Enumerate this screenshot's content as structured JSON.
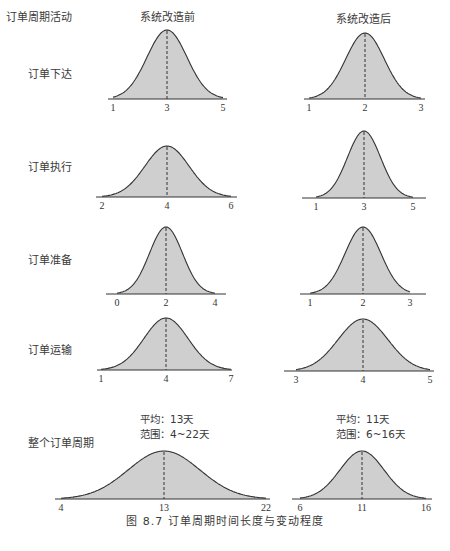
{
  "header": {
    "row_label_title": "订单周期活动",
    "col_before": "系统改造前",
    "col_after": "系统改造后"
  },
  "rows": [
    {
      "label": "订单下达"
    },
    {
      "label": "订单执行"
    },
    {
      "label": "订单准备"
    },
    {
      "label": "订单运输"
    },
    {
      "label": "整个订单周期"
    }
  ],
  "summary": {
    "before": {
      "mean": "平均：13天",
      "range": "范围：4~22天"
    },
    "after": {
      "mean": "平均：11天",
      "range": "范围：6~16天"
    }
  },
  "caption": "图 8.7   订单周期时间长度与变动程度",
  "colors": {
    "fill": "#cfcfcf",
    "stroke": "#333333",
    "axis": "#333333"
  },
  "chart_data": {
    "type": "area",
    "title": "订单周期时间长度与变动程度",
    "figure_number": "图 8.7",
    "columns": [
      "系统改造前",
      "系统改造后"
    ],
    "rows": [
      "订单下达",
      "订单执行",
      "订单准备",
      "订单运输",
      "整个订单周期"
    ],
    "xlabel": "",
    "ylabel": "",
    "grid": false,
    "curves": [
      {
        "row": "订单下达",
        "column": "系统改造前",
        "min": 1,
        "mean": 3,
        "max": 5,
        "ticks": [
          "1",
          "3",
          "5"
        ],
        "geom": {
          "x0": 108,
          "x1": 227,
          "cx": 167,
          "base": 99,
          "peak": 30,
          "tl": 113,
          "tr": 223,
          "spread": 58
        }
      },
      {
        "row": "订单下达",
        "column": "系统改造后",
        "min": 1,
        "mean": 2,
        "max": 3,
        "ticks": [
          "1",
          "2",
          "3"
        ],
        "geom": {
          "x0": 304,
          "x1": 425,
          "cx": 365,
          "base": 99,
          "peak": 33,
          "tl": 309,
          "tr": 421,
          "spread": 56
        }
      },
      {
        "row": "订单执行",
        "column": "系统改造前",
        "min": 2,
        "mean": 4,
        "max": 6,
        "ticks": [
          "2",
          "4",
          "6"
        ],
        "geom": {
          "x0": 96,
          "x1": 237,
          "cx": 167,
          "base": 197,
          "peak": 146,
          "tl": 102,
          "tr": 231,
          "spread": 64
        }
      },
      {
        "row": "订单执行",
        "column": "系统改造后",
        "min": 1,
        "mean": 3,
        "max": 5,
        "ticks": [
          "1",
          "3",
          "5"
        ],
        "geom": {
          "x0": 302,
          "x1": 426,
          "cx": 364,
          "base": 198,
          "peak": 131,
          "tl": 316,
          "tr": 413,
          "spread": 48
        }
      },
      {
        "row": "订单准备",
        "column": "系统改造前",
        "min": 0,
        "mean": 2,
        "max": 4,
        "ticks": [
          "0",
          "2",
          "4"
        ],
        "geom": {
          "x0": 106,
          "x1": 226,
          "cx": 166,
          "base": 294,
          "peak": 227,
          "tl": 117,
          "tr": 215,
          "spread": 48
        }
      },
      {
        "row": "订单准备",
        "column": "系统改造后",
        "min": 1,
        "mean": 2,
        "max": 3,
        "ticks": [
          "1",
          "2",
          "3"
        ],
        "geom": {
          "x0": 300,
          "x1": 426,
          "cx": 363,
          "base": 294,
          "peak": 227,
          "tl": 310,
          "tr": 410,
          "spread": 52
        }
      },
      {
        "row": "订单运输",
        "column": "系统改造前",
        "min": 1,
        "mean": 4,
        "max": 7,
        "ticks": [
          "1",
          "4",
          "7"
        ],
        "geom": {
          "x0": 97,
          "x1": 232,
          "cx": 166,
          "base": 370,
          "peak": 318,
          "tl": 101,
          "tr": 231,
          "spread": 64
        }
      },
      {
        "row": "订单运输",
        "column": "系统改造后",
        "min": 3,
        "mean": 4,
        "max": 5,
        "ticks": [
          "3",
          "4",
          "5"
        ],
        "geom": {
          "x0": 284,
          "x1": 434,
          "cx": 363,
          "base": 371,
          "peak": 319,
          "tl": 296,
          "tr": 430,
          "spread": 72
        }
      },
      {
        "row": "整个订单周期",
        "column": "系统改造前",
        "min": 4,
        "mean": 13,
        "max": 22,
        "ticks": [
          "4",
          "13",
          "22"
        ],
        "geom": {
          "x0": 55,
          "x1": 270,
          "cx": 164,
          "base": 499,
          "peak": 451,
          "tl": 61,
          "tr": 266,
          "spread": 104
        },
        "annotation": {
          "mean_days": 13,
          "range_days": [
            4,
            22
          ]
        }
      },
      {
        "row": "整个订单周期",
        "column": "系统改造后",
        "min": 6,
        "mean": 11,
        "max": 16,
        "ticks": [
          "6",
          "11",
          "16"
        ],
        "geom": {
          "x0": 292,
          "x1": 432,
          "cx": 362,
          "base": 499,
          "peak": 451,
          "tl": 300,
          "tr": 426,
          "spread": 64
        },
        "annotation": {
          "mean_days": 11,
          "range_days": [
            6,
            16
          ]
        }
      }
    ]
  }
}
